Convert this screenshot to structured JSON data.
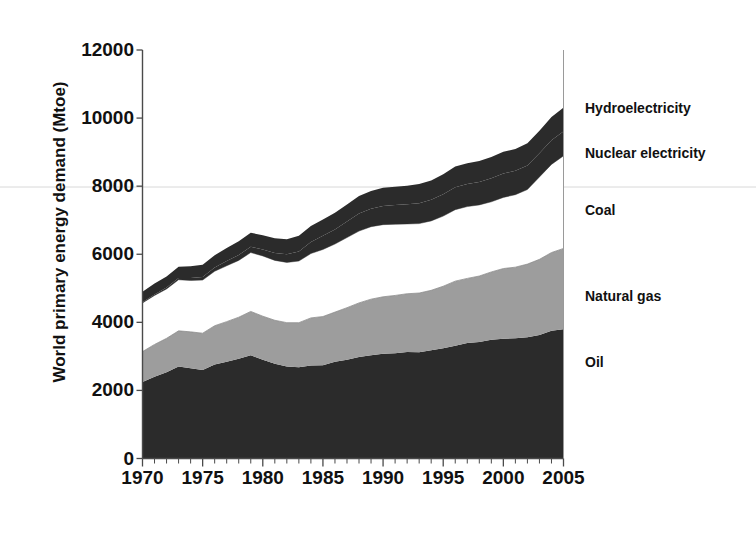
{
  "chart_data": {
    "type": "area",
    "title": "",
    "subtitle": "",
    "xlabel": "",
    "ylabel": "World primary energy demand (Mtoe)",
    "xlim": [
      1970,
      2005
    ],
    "ylim": [
      0,
      12000
    ],
    "grid": false,
    "legend_position": "right-inline-annotations",
    "stacked": true,
    "y_ticks": [
      0,
      2000,
      4000,
      6000,
      8000,
      10000,
      12000
    ],
    "y_tick_labels": [
      "0",
      "2000",
      "4000",
      "6000",
      "8000",
      "10000",
      "12000"
    ],
    "x_ticks": [
      1970,
      1975,
      1980,
      1985,
      1990,
      1995,
      2000,
      2005
    ],
    "x_tick_labels": [
      "1970",
      "1975",
      "1980",
      "1985",
      "1990",
      "1995",
      "2000",
      "2005"
    ],
    "x_minor_tick_interval": 1,
    "x": [
      1970,
      1971,
      1972,
      1973,
      1974,
      1975,
      1976,
      1977,
      1978,
      1979,
      1980,
      1981,
      1982,
      1983,
      1984,
      1985,
      1986,
      1987,
      1988,
      1989,
      1990,
      1991,
      1992,
      1993,
      1994,
      1995,
      1996,
      1997,
      1998,
      1999,
      2000,
      2001,
      2002,
      2003,
      2004,
      2005
    ],
    "series": [
      {
        "name": "Oil",
        "color": "#2b2b2b",
        "values": [
          2250,
          2400,
          2530,
          2700,
          2650,
          2600,
          2760,
          2840,
          2930,
          3030,
          2900,
          2780,
          2700,
          2680,
          2730,
          2740,
          2840,
          2900,
          2980,
          3030,
          3080,
          3090,
          3130,
          3120,
          3180,
          3240,
          3310,
          3390,
          3420,
          3490,
          3520,
          3530,
          3560,
          3630,
          3750,
          3800
        ]
      },
      {
        "name": "Natural gas",
        "color": "#9d9d9d",
        "values": [
          890,
          950,
          1000,
          1050,
          1070,
          1080,
          1140,
          1180,
          1220,
          1290,
          1280,
          1280,
          1290,
          1310,
          1400,
          1430,
          1460,
          1530,
          1590,
          1650,
          1670,
          1700,
          1710,
          1740,
          1760,
          1820,
          1900,
          1900,
          1940,
          1990,
          2060,
          2090,
          2150,
          2220,
          2300,
          2370
        ]
      },
      {
        "name": "Coal",
        "color": "#ffffff",
        "values": [
          1430,
          1440,
          1450,
          1500,
          1510,
          1560,
          1600,
          1640,
          1670,
          1730,
          1770,
          1760,
          1770,
          1810,
          1890,
          1970,
          2000,
          2060,
          2110,
          2130,
          2120,
          2090,
          2050,
          2040,
          2040,
          2060,
          2100,
          2110,
          2090,
          2060,
          2090,
          2130,
          2190,
          2420,
          2590,
          2720
        ]
      },
      {
        "name": "Nuclear electricity",
        "color": "#2b2b2b",
        "values": [
          20,
          30,
          40,
          50,
          70,
          90,
          110,
          140,
          160,
          170,
          190,
          220,
          240,
          280,
          340,
          400,
          430,
          470,
          520,
          530,
          550,
          570,
          580,
          600,
          620,
          640,
          660,
          660,
          670,
          690,
          700,
          700,
          710,
          700,
          710,
          720
        ]
      },
      {
        "name": "Hydroelectricity",
        "color": "#2b2b2b",
        "values": [
          310,
          320,
          330,
          330,
          350,
          360,
          360,
          380,
          400,
          410,
          420,
          430,
          440,
          460,
          470,
          480,
          490,
          500,
          510,
          520,
          530,
          530,
          540,
          560,
          570,
          590,
          610,
          610,
          620,
          630,
          640,
          640,
          650,
          660,
          680,
          700
        ]
      }
    ],
    "annotations": [
      {
        "label": "Hydroelectricity",
        "x_px": 585,
        "y_px": 101
      },
      {
        "label": "Nuclear electricity",
        "x_px": 585,
        "y_px": 146
      },
      {
        "label": "Coal",
        "x_px": 585,
        "y_px": 203
      },
      {
        "label": "Natural gas",
        "x_px": 585,
        "y_px": 289
      },
      {
        "label": "Oil",
        "x_px": 585,
        "y_px": 355
      }
    ]
  },
  "axes": {
    "y_title": "World primary energy demand (Mtoe)"
  }
}
